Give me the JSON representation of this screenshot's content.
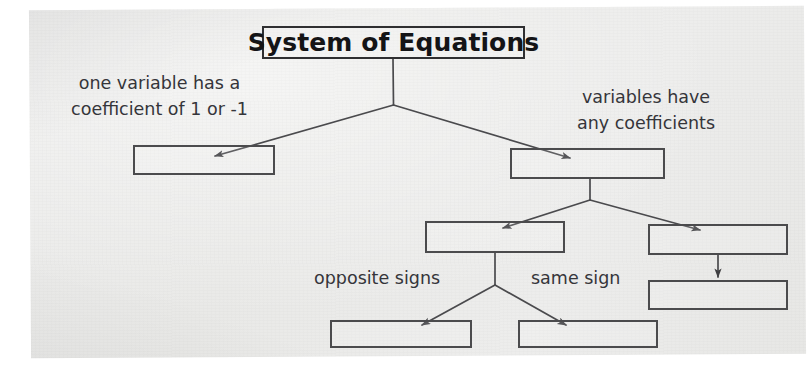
{
  "document": {
    "kind": "hand-drawn-flowchart-scan",
    "paper_color": "#eaeae8",
    "ink_color": "#4b4b4d"
  },
  "title_node": {
    "label": "System of Equations",
    "x": 262,
    "y": 26,
    "w": 263,
    "h": 33
  },
  "annotations": [
    {
      "id": "left-branch-note",
      "lines": [
        "one variable has a",
        "coefficient of 1 or -1"
      ],
      "x": 52,
      "y": 70
    },
    {
      "id": "right-branch-note",
      "lines": [
        "variables have",
        "any coefficients"
      ],
      "x": 548,
      "y": 84
    },
    {
      "id": "opposite-signs-note",
      "lines": [
        "opposite signs"
      ],
      "x": 314,
      "y": 265
    },
    {
      "id": "same-sign-note",
      "lines": [
        "same sign"
      ],
      "x": 531,
      "y": 265
    }
  ],
  "boxes": [
    {
      "id": "box-substitution",
      "label": "",
      "x": 133,
      "y": 145,
      "w": 142,
      "h": 30
    },
    {
      "id": "box-elimination",
      "label": "",
      "x": 510,
      "y": 148,
      "w": 155,
      "h": 31
    },
    {
      "id": "box-elim-add-subtract",
      "label": "",
      "x": 425,
      "y": 221,
      "w": 140,
      "h": 32
    },
    {
      "id": "box-elim-multiply",
      "label": "",
      "x": 648,
      "y": 224,
      "w": 140,
      "h": 31
    },
    {
      "id": "box-elim-multiply-then",
      "label": "",
      "x": 648,
      "y": 280,
      "w": 140,
      "h": 30
    },
    {
      "id": "box-subtract",
      "label": "",
      "x": 330,
      "y": 320,
      "w": 142,
      "h": 28
    },
    {
      "id": "box-add",
      "label": "",
      "x": 518,
      "y": 320,
      "w": 140,
      "h": 28
    }
  ],
  "connectors": [
    {
      "id": "title-to-left",
      "from": "title_node",
      "to": "box-substitution",
      "type": "elbow-arrow"
    },
    {
      "id": "title-to-right",
      "from": "title_node",
      "to": "box-elimination",
      "type": "elbow-arrow"
    },
    {
      "id": "elim-to-addsub",
      "from": "box-elimination",
      "to": "box-elim-add-subtract",
      "type": "elbow-arrow"
    },
    {
      "id": "elim-to-multiply",
      "from": "box-elimination",
      "to": "box-elim-multiply",
      "type": "elbow-arrow"
    },
    {
      "id": "multiply-to-then",
      "from": "box-elim-multiply",
      "to": "box-elim-multiply-then",
      "type": "straight-arrow"
    },
    {
      "id": "addsub-to-subtract",
      "from": "box-elim-add-subtract",
      "to": "box-subtract",
      "type": "elbow-arrow"
    },
    {
      "id": "addsub-to-add",
      "from": "box-elim-add-subtract",
      "to": "box-add",
      "type": "elbow-arrow"
    }
  ]
}
